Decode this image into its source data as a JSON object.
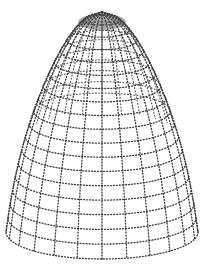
{
  "figure": {
    "style": "stippled grayscale mesh",
    "colors": {
      "background": "#ffffff",
      "mesh": "#3a3a3a"
    },
    "mesh": {
      "meridians": 24,
      "latitude_rings": 18
    },
    "geometry": {
      "apex": [
        102,
        12
      ],
      "rim_center": [
        102,
        232
      ],
      "rim_rx": 96,
      "rim_ry": 30
    }
  }
}
